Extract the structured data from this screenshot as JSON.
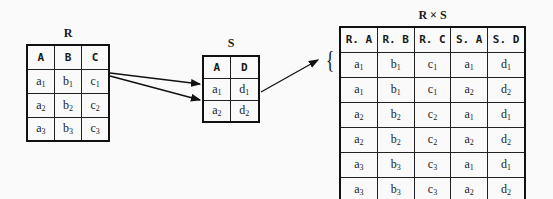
{
  "relations": {
    "R": {
      "title": "R",
      "headers": [
        "A",
        "B",
        "C"
      ],
      "rows": [
        [
          [
            "a",
            "1"
          ],
          [
            "b",
            "1"
          ],
          [
            "c",
            "1"
          ]
        ],
        [
          [
            "a",
            "2"
          ],
          [
            "b",
            "2"
          ],
          [
            "c",
            "2"
          ]
        ],
        [
          [
            "a",
            "3"
          ],
          [
            "b",
            "3"
          ],
          [
            "c",
            "3"
          ]
        ]
      ]
    },
    "S": {
      "title": "S",
      "headers": [
        "A",
        "D"
      ],
      "rows": [
        [
          [
            "a",
            "1"
          ],
          [
            "d",
            "1"
          ]
        ],
        [
          [
            "a",
            "2"
          ],
          [
            "d",
            "2"
          ]
        ]
      ]
    },
    "RxS": {
      "title": "R × S",
      "headers": [
        "R. A",
        "R. B",
        "R. C",
        "S. A",
        "S. D"
      ],
      "rows": [
        [
          [
            "a",
            "1"
          ],
          [
            "b",
            "1"
          ],
          [
            "c",
            "1"
          ],
          [
            "a",
            "1"
          ],
          [
            "d",
            "1"
          ]
        ],
        [
          [
            "a",
            "1"
          ],
          [
            "b",
            "1"
          ],
          [
            "c",
            "1"
          ],
          [
            "a",
            "2"
          ],
          [
            "d",
            "2"
          ]
        ],
        [
          [
            "a",
            "2"
          ],
          [
            "b",
            "2"
          ],
          [
            "c",
            "2"
          ],
          [
            "a",
            "1"
          ],
          [
            "d",
            "1"
          ]
        ],
        [
          [
            "a",
            "2"
          ],
          [
            "b",
            "2"
          ],
          [
            "c",
            "2"
          ],
          [
            "a",
            "2"
          ],
          [
            "d",
            "2"
          ]
        ],
        [
          [
            "a",
            "3"
          ],
          [
            "b",
            "3"
          ],
          [
            "c",
            "3"
          ],
          [
            "a",
            "1"
          ],
          [
            "d",
            "1"
          ]
        ],
        [
          [
            "a",
            "3"
          ],
          [
            "b",
            "3"
          ],
          [
            "c",
            "3"
          ],
          [
            "a",
            "2"
          ],
          [
            "d",
            "2"
          ]
        ]
      ]
    }
  },
  "annotations": {
    "brace": "{"
  },
  "colors": {
    "line": "#111111",
    "background": "#fafafa"
  }
}
